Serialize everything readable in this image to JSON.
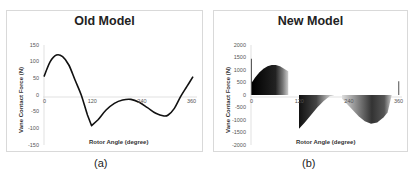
{
  "chart_data": [
    {
      "type": "line",
      "title": "Old Model",
      "xlabel": "Rotor Angle (degree)",
      "ylabel": "Vane Contact Force (N)",
      "caption": "(a)",
      "xlim": [
        0,
        360
      ],
      "ylim": [
        -150,
        150
      ],
      "x_ticks": [
        "0",
        "120",
        "240",
        "360"
      ],
      "y_ticks": [
        "150",
        "100",
        "50",
        "0",
        "-50",
        "-100",
        "-150"
      ],
      "grid": false,
      "series": [
        {
          "name": "Vane Contact Force",
          "x": [
            0,
            15,
            30,
            45,
            60,
            75,
            90,
            105,
            115,
            130,
            150,
            170,
            190,
            210,
            230,
            250,
            270,
            290,
            300,
            315,
            330,
            345,
            360
          ],
          "y": [
            55,
            100,
            120,
            115,
            90,
            45,
            0,
            -60,
            -92,
            -75,
            -45,
            -25,
            -15,
            -13,
            -22,
            -38,
            -55,
            -63,
            -60,
            -40,
            -5,
            25,
            55
          ]
        }
      ]
    },
    {
      "type": "area",
      "title": "New Model",
      "xlabel": "Rotor Angle (degree)",
      "ylabel": "Vane Contact Force (N)",
      "caption": "(b)",
      "xlim": [
        0,
        360
      ],
      "ylim": [
        -2000,
        2000
      ],
      "x_ticks": [
        "0",
        "120",
        "240",
        "360"
      ],
      "y_ticks": [
        "2000",
        "1500",
        "1000",
        "500",
        "0",
        "-500",
        "-1000",
        "-1500",
        "-2000"
      ],
      "grid": false,
      "series": [
        {
          "name": "Vane Contact Force",
          "x": [
            0,
            1,
            2,
            10,
            20,
            30,
            40,
            50,
            60,
            70,
            80,
            90,
            95,
            110,
            115,
            116,
            130,
            145,
            160,
            175,
            190,
            200,
            220,
            240,
            260,
            275,
            290,
            305,
            320,
            330,
            340,
            355,
            357,
            360
          ],
          "y": [
            0,
            1450,
            500,
            700,
            900,
            1050,
            1150,
            1200,
            1200,
            1150,
            1050,
            950,
            0,
            0,
            0,
            -1350,
            -1100,
            -800,
            -500,
            -250,
            -50,
            -20,
            -150,
            -500,
            -850,
            -1050,
            -1150,
            -1100,
            -900,
            -700,
            0,
            0,
            550,
            0
          ]
        }
      ]
    }
  ]
}
